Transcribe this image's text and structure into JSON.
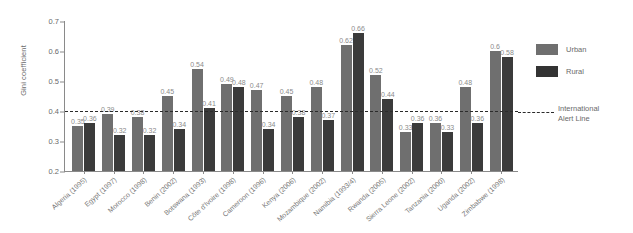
{
  "chart_data": {
    "type": "bar",
    "title": "",
    "xlabel": "",
    "ylabel": "Gini coefficient",
    "ylim": [
      0.2,
      0.7
    ],
    "yticks": [
      "0.2",
      "0.3",
      "0.4",
      "0.5",
      "0.6",
      "0.7"
    ],
    "grid": false,
    "legend_position": "right",
    "categories": [
      "Algeria (1995)",
      "Egypt (1997)",
      "Morocco (1998)",
      "Benin (2002)",
      "Botswana (1993)",
      "Côte d'Ivoire (1998)",
      "Cameroon (1996)",
      "Kenya (2006)",
      "Mozambique (2002)",
      "Namibia (1993/4)",
      "Rwanda (2005)",
      "Sierra Leone (2002)",
      "Tanzania (2000)",
      "Uganda (2002)",
      "Zimbabwe (1998)"
    ],
    "series": [
      {
        "name": "Urban",
        "color": "#6f6f6f",
        "values": [
          0.35,
          0.39,
          0.38,
          0.45,
          0.54,
          0.49,
          0.47,
          0.45,
          0.48,
          0.62,
          0.52,
          0.33,
          0.36,
          0.48,
          0.6
        ],
        "labels": [
          "0.35",
          "0.39",
          "0.38",
          "0.45",
          "0.54",
          "0.49",
          "0.47",
          "0.45",
          "0.48",
          "0.62",
          "0.52",
          "0.33",
          "0.36",
          "0.48",
          "0.6"
        ]
      },
      {
        "name": "Rural",
        "color": "#3b3b3b",
        "values": [
          0.36,
          0.32,
          0.32,
          0.34,
          0.41,
          0.48,
          0.34,
          0.38,
          0.37,
          0.66,
          0.44,
          0.36,
          0.33,
          0.36,
          0.58
        ],
        "labels": [
          "0.36",
          "0.32",
          "0.32",
          "0.34",
          "0.41",
          "0.48",
          "0.34",
          "0.38",
          "0.37",
          "0.66",
          "0.44",
          "0.36",
          "0.33",
          "0.36",
          "0.58"
        ]
      }
    ],
    "annotations": [
      {
        "name": "international-alert-line",
        "label": "International\nAlert Line",
        "value": 0.4,
        "style": "dashed",
        "color": "#2b2b2b"
      }
    ]
  },
  "legend": {
    "urban_label": "Urban",
    "rural_label": "Rural",
    "alert_line_label_1": "International",
    "alert_line_label_2": "Alert Line"
  }
}
